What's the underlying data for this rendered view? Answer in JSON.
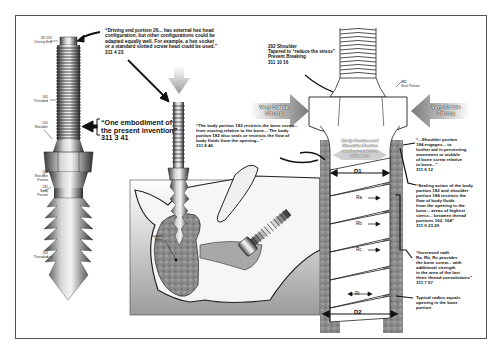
{
  "figure": {
    "left_screw": {
      "labels": [
        {
          "id": "driving-end",
          "text": "26/ 162\nDriving End"
        },
        {
          "id": "threaded-top",
          "text": "162\nThreaded"
        },
        {
          "id": "shoulder",
          "text": "202\nShoulder"
        },
        {
          "id": "shoulder-portion",
          "text": "184\nShoulder\nPortion"
        },
        {
          "id": "body-portion",
          "text": "182\nBody\nPortion"
        },
        {
          "id": "threaded-bottom",
          "text": "164\nThreaded"
        }
      ]
    },
    "callouts": {
      "driving_end": "“Driving end portion 26... has external hex head\nconfiguration, but other configurations could be\nadapted equally well. For example, a hex socket\nor a standard slotted screw head could be used.”\n311 4 23",
      "embodiment": "“One embodiment of\nthe present invention”\n311 3 41",
      "body_portion": "“The body portion 182 restricts the bone screw...\nfrom moving relative to the bone... The body\nportion 182 also seals or restricts the flow of\nbody fluids from the opening...”\n311 8 46",
      "shoulder_202": "202 Shoulder\nTapered to “reduce the stress”\nPrevent Breaking\n311 10 16",
      "seat_portion": "164\nSeat Portion",
      "stable_left": "Very Stable\nStrong",
      "stable_right": "Very Stable\nStrong",
      "seals": "Body Portion and\nShoulder Portion\nseals or restricts\neffluence",
      "shoulder_184": "“...Shoulder portion\n184 engages... to\nfurther aid in preventing\nmovement or wobble\nof bone screw relative\nto bone...”\n311 9 12",
      "sealing_action": "“Sealing action of the body\nportion 182 and shoulder\nportion 184 restricts the\nflow of body fluids\nfrom the opening in the\nbone... areas of highest\nstress... between thread\nportions 162, 164”\n311 9 23-29",
      "increased_radii": "“Increased radii\nRa, Rb, Rc provides\nthe bone screw... with\nadditional strength\nin the area of the last\nthree thread convolutions”\n311 7 57",
      "typical_radius": "Typical radius equals\nopening in the bone\nportion",
      "tapped_hole": "Tapped\nHole"
    },
    "dimensions": {
      "d1": "D1",
      "d2": "D2",
      "ra": "Ra",
      "rb": "Rb",
      "rc": "Rc",
      "rt": "Rt"
    }
  }
}
